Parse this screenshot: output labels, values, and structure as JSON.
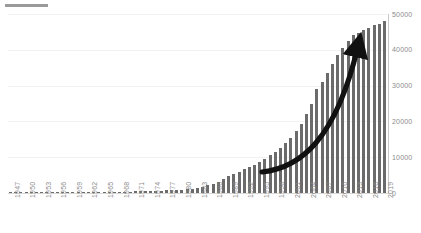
{
  "title_bar": {
    "redacted": true,
    "label": ""
  },
  "colors": {
    "bar": "#6b6b6b",
    "gridline": "#f2f2f2",
    "axis": "#c8c8c8",
    "tick_label": "#8c8c8c",
    "arrow": "#111111",
    "background": "#ffffff"
  },
  "annotations": [
    {
      "name": "growth-arrow",
      "type": "curved-arrow",
      "description": "thick black curved arrow rising left-to-right over the bars",
      "start": [
        262,
        172
      ],
      "end": [
        366,
        28
      ]
    }
  ],
  "chart_data": {
    "type": "bar",
    "title": "",
    "xlabel": "",
    "ylabel": "",
    "ylim": [
      0,
      50000
    ],
    "yticks": [
      0,
      10000,
      20000,
      30000,
      40000,
      50000
    ],
    "ytick_labels": [
      "0",
      "10000",
      "20000",
      "30000",
      "40000",
      "50000"
    ],
    "grid": true,
    "legend": false,
    "xtick_labels": [
      "1947",
      "1950",
      "1953",
      "1956",
      "1959",
      "1962",
      "1965",
      "1968",
      "1971",
      "1974",
      "1977",
      "1980",
      "1983",
      "1986",
      "1989",
      "1992",
      "1995",
      "1998",
      "2001",
      "2004",
      "2007",
      "2010",
      "2013",
      "2016",
      "2019"
    ],
    "xtick_step": 3,
    "categories": [
      "1947",
      "1948",
      "1949",
      "1950",
      "1951",
      "1952",
      "1953",
      "1954",
      "1955",
      "1956",
      "1957",
      "1958",
      "1959",
      "1960",
      "1961",
      "1962",
      "1963",
      "1964",
      "1965",
      "1966",
      "1967",
      "1968",
      "1969",
      "1970",
      "1971",
      "1972",
      "1973",
      "1974",
      "1975",
      "1976",
      "1977",
      "1978",
      "1979",
      "1980",
      "1981",
      "1982",
      "1983",
      "1984",
      "1985",
      "1986",
      "1987",
      "1988",
      "1989",
      "1990",
      "1991",
      "1992",
      "1993",
      "1994",
      "1995",
      "1996",
      "1997",
      "1998",
      "1999",
      "2000",
      "2001",
      "2002",
      "2003",
      "2004",
      "2005",
      "2006",
      "2007",
      "2008",
      "2009",
      "2010",
      "2011",
      "2012",
      "2013",
      "2014",
      "2015",
      "2016",
      "2017",
      "2018",
      "2019"
    ],
    "values": [
      30,
      35,
      40,
      45,
      50,
      55,
      60,
      70,
      80,
      90,
      100,
      120,
      140,
      160,
      190,
      220,
      400,
      420,
      260,
      280,
      300,
      330,
      360,
      400,
      440,
      480,
      520,
      570,
      620,
      680,
      740,
      800,
      870,
      950,
      1050,
      1200,
      1400,
      1700,
      2100,
      2600,
      3200,
      3900,
      4700,
      5400,
      6000,
      6600,
      7200,
      7900,
      8700,
      9600,
      10500,
      11500,
      12600,
      13900,
      15400,
      17200,
      19400,
      22000,
      25000,
      29000,
      31000,
      33500,
      36000,
      38500,
      40500,
      42500,
      44000,
      44800,
      45500,
      46200,
      46800,
      47300,
      48000
    ]
  }
}
